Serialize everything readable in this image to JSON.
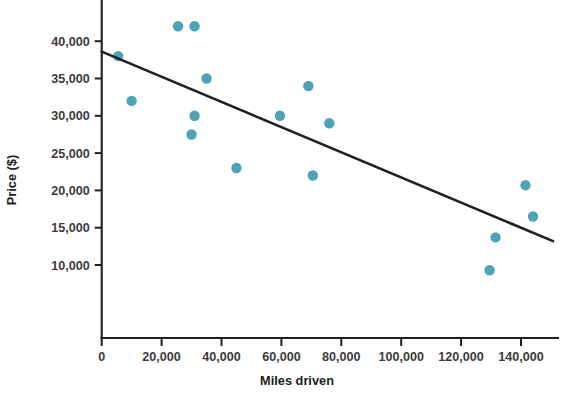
{
  "chart_data": {
    "type": "scatter",
    "title": "",
    "xlabel": "Miles driven",
    "ylabel": "Price ($)",
    "xlim": [
      0,
      150000
    ],
    "ylim": [
      7500,
      43500
    ],
    "grid": false,
    "legend": "none",
    "x_ticks": [
      0,
      20000,
      40000,
      60000,
      80000,
      100000,
      120000,
      140000
    ],
    "x_tick_labels": [
      "0",
      "20,000",
      "40,000",
      "60,000",
      "80,000",
      "100,000",
      "120,000",
      "140,000"
    ],
    "y_ticks": [
      10000,
      15000,
      20000,
      25000,
      30000,
      35000,
      40000
    ],
    "y_tick_labels": [
      "10,000",
      "15,000",
      "20,000",
      "25,000",
      "30,000",
      "35,000",
      "40,000"
    ],
    "point_color": "#4ea3b9",
    "line_color": "#231f20",
    "points": [
      {
        "x": 25500,
        "y": 42000
      },
      {
        "x": 31000,
        "y": 42000
      },
      {
        "x": 5500,
        "y": 38000
      },
      {
        "x": 35000,
        "y": 35000
      },
      {
        "x": 69000,
        "y": 34000
      },
      {
        "x": 10000,
        "y": 32000
      },
      {
        "x": 31000,
        "y": 30000
      },
      {
        "x": 59500,
        "y": 30000
      },
      {
        "x": 76000,
        "y": 29000
      },
      {
        "x": 30000,
        "y": 27500
      },
      {
        "x": 45000,
        "y": 23000
      },
      {
        "x": 70500,
        "y": 22000
      },
      {
        "x": 141500,
        "y": 20700
      },
      {
        "x": 144000,
        "y": 16500
      },
      {
        "x": 131500,
        "y": 13700
      },
      {
        "x": 129500,
        "y": 9300
      }
    ],
    "trendline": {
      "name": "line of best fit",
      "x_start": 0,
      "y_start": 38600,
      "x_end": 150700,
      "y_end": 13200
    }
  }
}
